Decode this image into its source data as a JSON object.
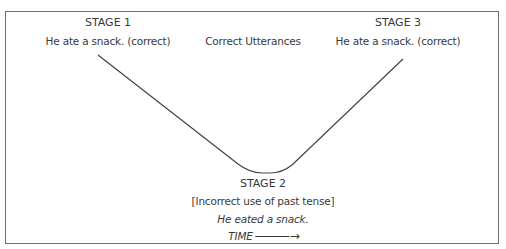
{
  "diagram": {
    "type": "u-shaped-development",
    "line_color": "#444444",
    "frame_color": "#6e6e6e",
    "stage1": {
      "title": "STAGE 1",
      "example": "He ate a snack. (correct)"
    },
    "center_label": "Correct Utterances",
    "stage3": {
      "title": "STAGE 3",
      "example": "He ate a snack. (correct)"
    },
    "stage2": {
      "title": "STAGE 2",
      "description": "[Incorrect use of past tense]",
      "example": "He eated a snack."
    },
    "time_axis": {
      "label": "TIME",
      "arrow": "→"
    }
  }
}
